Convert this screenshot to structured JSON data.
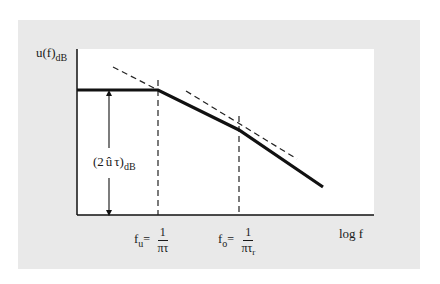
{
  "diagram": {
    "type": "bode-magnitude-asymptote",
    "colors": {
      "frame_background": "#e9e9e9",
      "plot_background": "#ffffff",
      "line": "#111111"
    },
    "y_axis": {
      "label_main": "u(f)",
      "label_sub": "dB"
    },
    "x_axis": {
      "label": "log f"
    },
    "amplitude_label": {
      "open": "(2",
      "symbol": "û",
      "tau": "τ)",
      "sub": "dB"
    },
    "corner_frequencies": [
      {
        "name": "f",
        "sub": "u",
        "equals": "=",
        "numerator": "1",
        "denominator": "πτ",
        "denominator_sub": ""
      },
      {
        "name": "f",
        "sub": "o",
        "equals": "=",
        "numerator": "1",
        "denominator": "πτ",
        "denominator_sub": "r"
      }
    ],
    "curve": {
      "segments": [
        {
          "description": "flat plateau",
          "from": [
            77,
            90
          ],
          "to": [
            158,
            90
          ]
        },
        {
          "description": "first slope",
          "from": [
            158,
            90
          ],
          "to": [
            239,
            130
          ]
        },
        {
          "description": "second steeper slope",
          "from": [
            239,
            130
          ],
          "to": [
            323,
            187
          ]
        }
      ],
      "asymptotes_dashed": [
        {
          "from": [
            113,
            67
          ],
          "to": [
            158,
            90
          ]
        },
        {
          "from": [
            186,
            91
          ],
          "to": [
            297,
            159
          ]
        }
      ],
      "vertical_dashed_markers_x": [
        158,
        239
      ]
    }
  }
}
